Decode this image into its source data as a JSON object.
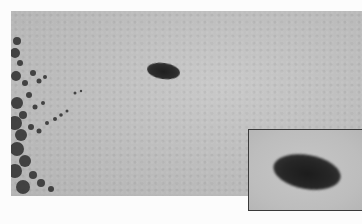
{
  "image": {
    "description": "Grayscale photograph of a dark elliptical object in an overcast sky with tree foliage at the left edge and a magnified inset of the object at bottom-right",
    "colors": {
      "sky": "#bdbdbd",
      "object": "#222222",
      "foliage": "#2a2a2a",
      "inset_border": "#3a3a3a",
      "page_background": "#fcfcfc"
    }
  }
}
